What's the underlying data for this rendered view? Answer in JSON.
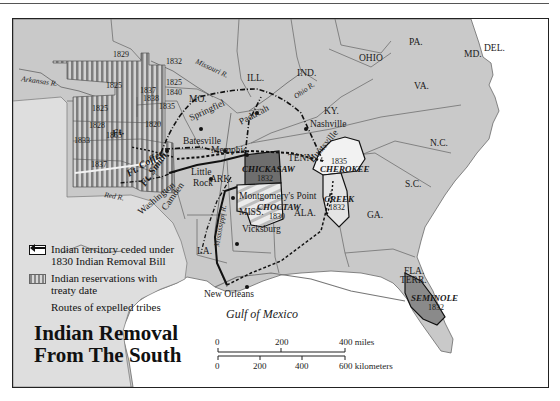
{
  "title": {
    "line1": "Indian Removal",
    "line2": "From The South"
  },
  "legend": {
    "items": [
      {
        "icon": "ceded-territory-swatch",
        "label_line1": "Indian territory ceded under",
        "label_line2": "1830 Indian Removal Bill"
      },
      {
        "icon": "reservation-stripes-swatch",
        "label_line1": "Indian reservations with",
        "label_line2": "treaty date"
      },
      {
        "icon": "arrow-left-icon",
        "label_line1": "Routes of expelled tribes",
        "label_line2": ""
      }
    ]
  },
  "water": {
    "gulf": "Gulf of Mexico"
  },
  "scale_bar": {
    "miles": [
      "0",
      "200",
      "400 miles"
    ],
    "kilometers": [
      "0",
      "200",
      "400",
      "600 kilometers"
    ]
  },
  "states": [
    "ILL.",
    "IND.",
    "OHIO",
    "PA.",
    "MD.",
    "DEL.",
    "VA.",
    "KY.",
    "N.C.",
    "TENN.",
    "S.C.",
    "GA.",
    "ALA.",
    "MISS.",
    "LA.",
    "ARK.",
    "MO.",
    "FLA. TERR."
  ],
  "cities": [
    "Springfiel",
    "Paducah",
    "Nashville",
    "Huntsville",
    "Batesville",
    "Memphis",
    "Little Rock",
    "Montgomery's Point",
    "Vicksburg",
    "New Orleans",
    "Washington",
    "Camden",
    "Ft. Coffee",
    "Ft. Smith",
    "Ft."
  ],
  "rivers": [
    "Arkansas R.",
    "Missouri R.",
    "Ohio R.",
    "Red R.",
    "Mississippi R."
  ],
  "tribes": [
    {
      "name": "CHICKASAW",
      "year": "1832"
    },
    {
      "name": "CHOCTAW",
      "year": "1830"
    },
    {
      "name": "CHEROKEE",
      "year": "1835"
    },
    {
      "name": "CREEK",
      "year": "1832"
    },
    {
      "name": "SEMINOLE",
      "year": "1832"
    }
  ],
  "reservation_years": [
    "1829",
    "1832",
    "1825",
    "1825",
    "1837",
    "1840",
    "1838",
    "1835",
    "1825",
    "1828",
    "1820",
    "1855",
    "1833",
    "1837"
  ],
  "colors": {
    "land": "#c9c9c9",
    "land_border": "#6a6a6a",
    "reservation_stripe_dark": "#7e7e7e",
    "reservation_stripe_light": "#d2d2d2",
    "chickasaw": "#6e6e6e",
    "seminole": "#8a8a8a",
    "ceded_fill": "#f2f2f2",
    "route": "#111111"
  }
}
